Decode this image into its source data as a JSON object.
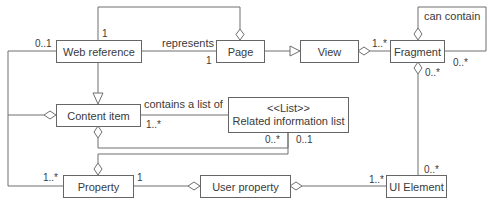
{
  "diagram": {
    "type": "UML class diagram",
    "classes": [
      {
        "id": "web_reference",
        "name": "Web reference"
      },
      {
        "id": "page",
        "name": "Page"
      },
      {
        "id": "view",
        "name": "View"
      },
      {
        "id": "fragment",
        "name": "Fragment"
      },
      {
        "id": "content_item",
        "name": "Content item"
      },
      {
        "id": "related_information_list",
        "stereotype": "<<List>>",
        "name": "Related information list"
      },
      {
        "id": "property",
        "name": "Property"
      },
      {
        "id": "user_property",
        "name": "User property"
      },
      {
        "id": "ui_element",
        "name": "UI Element"
      }
    ],
    "labels": {
      "represents": "represents",
      "contains_a_list_of": "contains a list of",
      "can_contain": "can contain"
    },
    "multiplicities": {
      "webref_top": "1",
      "webref_left": "0..1",
      "page_represents": "1",
      "view_fragment": "1..*",
      "fragment_self": "0..*",
      "fragment_bottom": "0..*",
      "content_list": "1..*",
      "list_left": "0..*",
      "list_right": "0..1",
      "property_left": "1..*",
      "property_right": "1",
      "uielement_top": "0..*",
      "uielement_left": "1..*"
    },
    "relations": [
      {
        "from": "Page",
        "to": "Web reference",
        "kind": "aggregation",
        "mult_to": "1"
      },
      {
        "from": "Web reference",
        "to": "Page",
        "kind": "association",
        "label": "represents",
        "mult_to": "1"
      },
      {
        "from": "Page",
        "to": "View",
        "kind": "generalization"
      },
      {
        "from": "View",
        "to": "Fragment",
        "kind": "aggregation",
        "mult_to": "1..*"
      },
      {
        "from": "Fragment",
        "to": "Fragment",
        "kind": "aggregation",
        "label": "can contain",
        "mult_to": "0..*"
      },
      {
        "from": "Fragment",
        "to": "UI Element",
        "kind": "aggregation",
        "mult_from": "0..*",
        "mult_to": "0..*"
      },
      {
        "from": "Content item",
        "to": "Web reference",
        "kind": "generalization"
      },
      {
        "from": "Content item",
        "to": "Web reference",
        "kind": "aggregation",
        "mult_to": "0..1"
      },
      {
        "from": "Content item",
        "to": "Related information list",
        "kind": "association",
        "label": "contains a list of",
        "mult_from": "1..*"
      },
      {
        "from": "Content item",
        "to": "Related information list",
        "kind": "aggregation",
        "mult_to": "0..*"
      },
      {
        "from": "Property",
        "to": "Related information list",
        "kind": "aggregation",
        "mult_to": "0..1"
      },
      {
        "from": "Property",
        "to": "Web reference",
        "kind": "association",
        "mult_from": "1..*"
      },
      {
        "from": "User property",
        "to": "Property",
        "kind": "aggregation",
        "mult_to": "1"
      },
      {
        "from": "User property",
        "to": "UI Element",
        "kind": "aggregation",
        "mult_to": "1..*"
      }
    ]
  },
  "colors": {
    "line": "#6e6e6e",
    "text": "#3a3a3a",
    "background": "#ffffff"
  }
}
